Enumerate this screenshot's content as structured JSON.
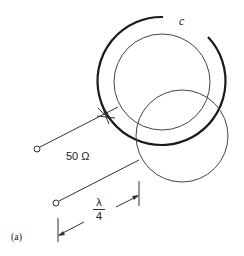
{
  "figure": {
    "panel_label": "(a)",
    "coil_label": "c",
    "impedance_label": "50 Ω",
    "dimension": {
      "numerator": "λ",
      "denominator": "4"
    }
  },
  "colors": {
    "line": "#333333",
    "thick_line": "#1a1a1a",
    "background": "#ffffff"
  }
}
